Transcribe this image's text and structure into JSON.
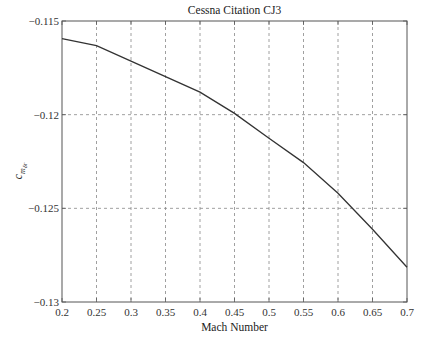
{
  "chart_data": {
    "type": "line",
    "title": "Cessna Citation CJ3",
    "xlabel": "Mach Number",
    "ylabel": "c_{m_{δ_r}}",
    "ylabel_parts": {
      "base": "c",
      "sub": "m",
      "subsub": "δr"
    },
    "xlim": [
      0.2,
      0.7
    ],
    "ylim": [
      -0.13,
      -0.115
    ],
    "grid": true,
    "x_ticks": [
      0.2,
      0.25,
      0.3,
      0.35,
      0.4,
      0.45,
      0.5,
      0.55,
      0.6,
      0.65,
      0.7
    ],
    "x_tick_labels": [
      "0.2",
      "0.25",
      "0.3",
      "0.35",
      "0.4",
      "0.45",
      "0.5",
      "0.55",
      "0.6",
      "0.65",
      "0.7"
    ],
    "y_ticks": [
      -0.115,
      -0.12,
      -0.125,
      -0.13
    ],
    "y_tick_labels": [
      "−0.115",
      "−0.12",
      "−0.125",
      "−0.13"
    ],
    "series": [
      {
        "name": "Cessna Citation CJ3",
        "color": "#333333",
        "x": [
          0.2,
          0.25,
          0.3,
          0.35,
          0.4,
          0.45,
          0.5,
          0.55,
          0.6,
          0.65,
          0.7
        ],
        "values": [
          -0.11594,
          -0.11632,
          -0.11714,
          -0.11797,
          -0.1188,
          -0.11993,
          -0.12126,
          -0.12256,
          -0.1242,
          -0.12612,
          -0.12815
        ]
      }
    ]
  }
}
